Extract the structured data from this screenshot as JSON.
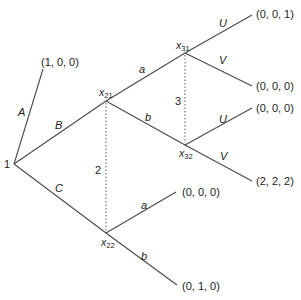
{
  "diagram": {
    "type": "extensive-form game tree",
    "root": {
      "label": "1",
      "x": 14,
      "y": 164
    },
    "nodes": [
      {
        "id": "x21",
        "label": "x",
        "sub": "21",
        "x": 106,
        "y": 101
      },
      {
        "id": "x22",
        "label": "x",
        "sub": "22",
        "x": 106,
        "y": 233
      },
      {
        "id": "x31",
        "label": "x",
        "sub": "31",
        "x": 185,
        "y": 53
      },
      {
        "id": "x32",
        "label": "x",
        "sub": "32",
        "x": 185,
        "y": 145
      }
    ],
    "information_sets": [
      {
        "player": "2",
        "members": [
          "x21",
          "x22"
        ]
      },
      {
        "player": "3",
        "members": [
          "x31",
          "x32"
        ]
      }
    ],
    "edges": [
      {
        "from": "1",
        "action": "A",
        "to_payoff": "(1, 0, 0)"
      },
      {
        "from": "1",
        "action": "B",
        "to": "x21"
      },
      {
        "from": "1",
        "action": "C",
        "to": "x22"
      },
      {
        "from": "x21",
        "action": "a",
        "to": "x31"
      },
      {
        "from": "x21",
        "action": "b",
        "to": "x32"
      },
      {
        "from": "x31",
        "action": "U",
        "to_payoff": "(0, 0, 1)"
      },
      {
        "from": "x31",
        "action": "V",
        "to_payoff": "(0, 0, 0)"
      },
      {
        "from": "x32",
        "action": "U",
        "to_payoff": "(0, 0, 0)"
      },
      {
        "from": "x32",
        "action": "V",
        "to_payoff": "(2, 2, 2)"
      },
      {
        "from": "x22",
        "action": "a",
        "to_payoff": "(0, 0, 0)"
      },
      {
        "from": "x22",
        "action": "b",
        "to_payoff": "(0, 1, 0)"
      }
    ],
    "labels": {
      "root_player": "1",
      "info_set_2": "2",
      "info_set_3": "3",
      "action_A": "A",
      "action_B": "B",
      "action_C": "C",
      "action_a_x21": "a",
      "action_b_x21": "b",
      "action_U_x31": "U",
      "action_V_x31": "V",
      "action_U_x32": "U",
      "action_V_x32": "V",
      "action_a_x22": "a",
      "action_b_x22": "b",
      "node_x": "x",
      "sub_21": "21",
      "sub_22": "22",
      "sub_31": "31",
      "sub_32": "32"
    },
    "payoffs": {
      "A": "(1, 0, 0)",
      "x31_U": "(0, 0, 1)",
      "x31_V": "(0, 0, 0)",
      "x32_U": "(0, 0, 0)",
      "x32_V": "(2, 2, 2)",
      "x22_a": "(0, 0, 0)",
      "x22_b": "(0, 1, 0)"
    }
  }
}
